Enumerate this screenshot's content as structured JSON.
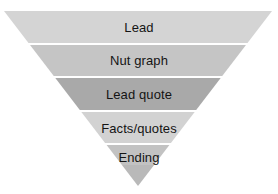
{
  "diagram": {
    "name": "inverted-pyramid",
    "background_color": "#ffffff",
    "separator_color": "#ffffff",
    "text_color": "#141414",
    "geometry": {
      "top_left_x": 4,
      "top_right_x": 272,
      "top_y": 11,
      "apex_x": 138,
      "apex_y": 186
    },
    "bands": [
      {
        "label": "Lead",
        "color": "#d4d4d4",
        "top_y": 11,
        "bottom_y": 43,
        "label_y": 21
      },
      {
        "label": "Nut graph",
        "color": "#c5c5c5",
        "top_y": 45,
        "bottom_y": 76,
        "label_y": 54
      },
      {
        "label": "Lead quote",
        "color": "#a9a9a9",
        "top_y": 78,
        "bottom_y": 110,
        "label_y": 88
      },
      {
        "label": "Facts/quotes",
        "color": "#d2d2d2",
        "top_y": 112,
        "bottom_y": 143,
        "label_y": 122
      },
      {
        "label": "Ending",
        "color": "#c2c2c2",
        "top_y": 145,
        "bottom_y": 165,
        "label_y": 151
      }
    ],
    "tip": {
      "color": "#b9b9b9",
      "top_y": 165,
      "bottom_y": 186
    }
  }
}
